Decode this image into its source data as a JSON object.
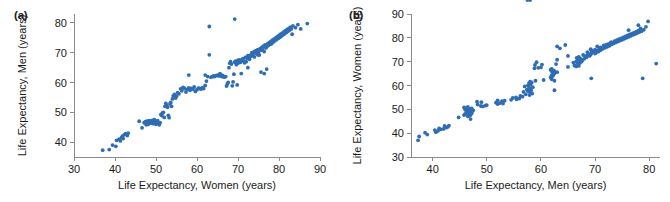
{
  "figure": {
    "background_color": "#ffffff",
    "marker_color": "#2e6db4",
    "axis_color": "#8a8a8a",
    "text_color": "#1a1a1a"
  },
  "panels": {
    "a": {
      "label": "(a)"
    },
    "b": {
      "label": "(b)"
    }
  },
  "chart_data": [
    {
      "type": "scatter",
      "panel": "(a)",
      "title": "",
      "xlabel": "Life Expectancy, Women (years)",
      "ylabel": "Life Expectancy, Men (years)",
      "xlim": [
        30,
        90
      ],
      "ylim": [
        35,
        83
      ],
      "xticks": [
        30,
        40,
        50,
        60,
        70,
        80,
        90
      ],
      "xticklabels": [
        "30",
        "40",
        "50",
        "60",
        "70",
        "80",
        "90"
      ],
      "yticks": [
        40,
        50,
        60,
        70,
        80
      ],
      "yticklabels": [
        "40",
        "50",
        "60",
        "70",
        "80"
      ],
      "grid": false,
      "legend": "none",
      "marker": "filled-circle",
      "n_points": 190,
      "x": [
        37.0,
        38.6,
        39.4,
        40.2,
        40.4,
        41.0,
        41.3,
        41.6,
        41.8,
        42.0,
        42.3,
        42.6,
        43.0,
        43.2,
        45.9,
        46.6,
        47.1,
        47.4,
        47.6,
        47.8,
        48.0,
        48.1,
        48.3,
        48.4,
        48.6,
        48.8,
        49.0,
        49.1,
        49.3,
        49.5,
        49.6,
        49.8,
        50.0,
        50.2,
        50.4,
        50.6,
        50.8,
        51.0,
        51.2,
        51.4,
        51.6,
        51.8,
        52.0,
        52.2,
        52.4,
        52.6,
        52.8,
        53.0,
        53.2,
        53.4,
        53.6,
        53.8,
        54.0,
        54.2,
        54.5,
        54.8,
        55.0,
        55.3,
        55.6,
        56.0,
        56.3,
        56.6,
        57.0,
        57.3,
        57.6,
        58.0,
        58.3,
        58.6,
        59.0,
        59.3,
        59.6,
        60.0,
        60.3,
        60.6,
        61.0,
        61.3,
        61.6,
        62.0,
        62.3,
        62.6,
        63.0,
        63.4,
        63.8,
        64.0,
        64.3,
        64.6,
        65.0,
        65.3,
        65.6,
        66.0,
        66.3,
        66.6,
        67.0,
        67.2,
        67.4,
        67.6,
        67.8,
        68.0,
        68.2,
        68.4,
        68.6,
        68.8,
        69.0,
        69.2,
        69.4,
        69.6,
        69.8,
        70.0,
        70.2,
        70.4,
        70.6,
        70.8,
        71.0,
        71.2,
        71.4,
        71.6,
        71.8,
        72.0,
        72.2,
        72.4,
        72.6,
        72.8,
        73.0,
        73.2,
        73.4,
        73.6,
        73.8,
        74.0,
        74.2,
        74.4,
        74.6,
        74.8,
        75.0,
        75.2,
        75.4,
        75.6,
        75.8,
        76.0,
        76.2,
        76.4,
        76.6,
        76.8,
        77.0,
        77.2,
        77.4,
        77.6,
        77.8,
        78.0,
        78.2,
        78.4,
        78.6,
        78.8,
        79.0,
        79.2,
        79.4,
        79.6,
        79.8,
        80.0,
        80.2,
        80.4,
        80.6,
        80.8,
        81.0,
        81.2,
        81.4,
        81.6,
        81.8,
        82.0,
        82.2,
        82.4,
        82.6,
        82.8,
        83.0,
        83.2,
        83.4,
        84.0,
        84.6,
        85.3,
        86.9,
        63.0,
        69.2,
        74.8,
        75.6,
        76.4,
        77.0,
        72.4,
        70.0,
        66.0,
        62.0,
        58.0
      ],
      "y": [
        37.3,
        37.5,
        39.0,
        38.6,
        40.6,
        41.0,
        40.4,
        41.5,
        42.0,
        41.2,
        42.5,
        42.8,
        42.2,
        43.0,
        47.0,
        44.8,
        46.5,
        46.9,
        45.8,
        47.0,
        46.6,
        46.0,
        47.2,
        46.3,
        46.8,
        47.1,
        46.4,
        47.3,
        46.2,
        46.9,
        47.5,
        46.5,
        46.0,
        46.7,
        47.2,
        46.3,
        45.8,
        46.5,
        49.3,
        48.9,
        49.8,
        50.0,
        48.3,
        52.0,
        53.0,
        52.4,
        51.7,
        49.0,
        48.2,
        52.8,
        53.3,
        52.0,
        54.5,
        55.5,
        56.0,
        54.8,
        55.4,
        56.6,
        56.2,
        57.9,
        57.2,
        58.4,
        58.0,
        56.8,
        57.6,
        58.2,
        57.4,
        58.0,
        57.8,
        58.5,
        57.0,
        57.6,
        58.1,
        58.0,
        57.8,
        58.3,
        58.0,
        59.0,
        60.5,
        62.0,
        69.3,
        61.8,
        62.0,
        62.2,
        62.0,
        62.3,
        62.5,
        62.2,
        63.0,
        62.0,
        62.3,
        61.8,
        62.0,
        58.8,
        59.5,
        60.0,
        65.0,
        66.5,
        67.0,
        66.2,
        58.9,
        60.2,
        62.8,
        66.8,
        67.2,
        66.0,
        59.2,
        66.5,
        67.0,
        67.6,
        66.8,
        63.0,
        67.5,
        68.0,
        67.2,
        66.6,
        68.4,
        67.0,
        68.2,
        69.0,
        68.5,
        67.8,
        69.2,
        68.8,
        70.0,
        69.4,
        70.2,
        68.6,
        70.6,
        69.8,
        70.4,
        71.0,
        70.0,
        69.2,
        71.4,
        70.8,
        71.8,
        71.0,
        72.2,
        70.4,
        72.6,
        71.6,
        72.0,
        73.0,
        72.4,
        73.4,
        72.8,
        73.8,
        73.0,
        74.2,
        73.6,
        74.6,
        74.0,
        75.0,
        74.4,
        75.4,
        74.8,
        75.8,
        75.2,
        76.2,
        75.6,
        76.6,
        76.0,
        77.0,
        76.4,
        77.4,
        76.8,
        77.8,
        77.2,
        78.2,
        77.6,
        78.6,
        78.0,
        76.2,
        79.0,
        78.4,
        79.4,
        78.0,
        79.8,
        78.8,
        81.3,
        69.3,
        63.5,
        63.0,
        64.5,
        65.0,
        67.5,
        62.5,
        62.5,
        62.5,
        58.0,
        57.5
      ]
    },
    {
      "type": "scatter",
      "panel": "(b)",
      "title": "",
      "xlabel": "Life Expectancy, Men (years)",
      "ylabel": "Life Expectancy, Women (years)",
      "xlim": [
        36,
        82
      ],
      "ylim": [
        30,
        90
      ],
      "xticks": [
        40,
        50,
        60,
        70,
        80
      ],
      "xticklabels": [
        "40",
        "50",
        "60",
        "70",
        "80"
      ],
      "yticks": [
        30,
        40,
        50,
        60,
        70,
        80,
        90
      ],
      "yticklabels": [
        "30",
        "40",
        "50",
        "60",
        "70",
        "80",
        "90"
      ],
      "grid": false,
      "legend": "none",
      "marker": "filled-circle",
      "n_points": 190,
      "note": "Same data as panel (a) with axes transposed: x = men, y = women"
    }
  ]
}
